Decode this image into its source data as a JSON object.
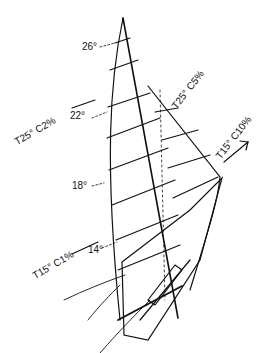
{
  "diagram": {
    "mainsail_twist_angles": [
      {
        "label": "26°",
        "x": 82,
        "y": 47
      },
      {
        "label": "22°",
        "x": 70,
        "y": 117
      },
      {
        "label": "18°",
        "x": 72,
        "y": 188
      },
      {
        "label": "14°",
        "x": 88,
        "y": 252
      }
    ],
    "trim_annotations": [
      {
        "label": "T25°  C5%",
        "x": 178,
        "y": 108,
        "rotate": -52
      },
      {
        "label": "T25°  C2%",
        "x": 18,
        "y": 146,
        "rotate": -30
      },
      {
        "label": "T15°  C10%",
        "x": 222,
        "y": 158,
        "rotate": -52
      },
      {
        "label": "T15°  C1%",
        "x": 36,
        "y": 278,
        "rotate": -30
      }
    ],
    "direction_arrow": "arrow-up-right"
  }
}
